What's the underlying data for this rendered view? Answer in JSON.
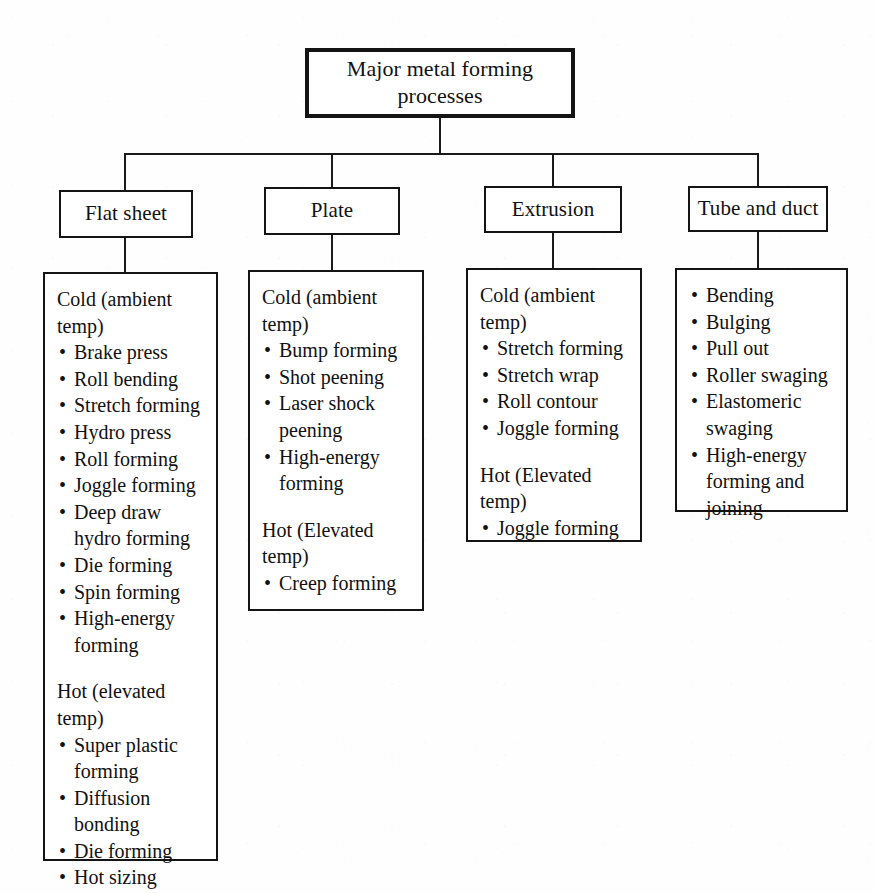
{
  "figure": {
    "type": "tree-diagram",
    "root": {
      "label": "Major metal forming processes"
    },
    "branches": [
      {
        "key": "flat-sheet",
        "label": "Flat sheet",
        "detail": [
          {
            "kind": "heading",
            "text": "Cold (ambient temp)"
          },
          {
            "kind": "bullet",
            "text": "Brake press"
          },
          {
            "kind": "bullet",
            "text": "Roll bending"
          },
          {
            "kind": "bullet",
            "text": "Stretch forming"
          },
          {
            "kind": "bullet",
            "text": "Hydro press"
          },
          {
            "kind": "bullet",
            "text": "Roll forming"
          },
          {
            "kind": "bullet",
            "text": "Joggle forming"
          },
          {
            "kind": "bullet",
            "text": "Deep draw hydro forming"
          },
          {
            "kind": "bullet",
            "text": "Die forming"
          },
          {
            "kind": "bullet",
            "text": "Spin forming"
          },
          {
            "kind": "bullet",
            "text": "High-energy forming"
          },
          {
            "kind": "spacer",
            "text": ""
          },
          {
            "kind": "heading",
            "text": "Hot (elevated temp)"
          },
          {
            "kind": "bullet",
            "text": "Super plastic forming"
          },
          {
            "kind": "bullet",
            "text": "Diffusion bonding"
          },
          {
            "kind": "bullet",
            "text": "Die forming"
          },
          {
            "kind": "bullet",
            "text": "Hot sizing"
          }
        ]
      },
      {
        "key": "plate",
        "label": "Plate",
        "detail": [
          {
            "kind": "heading",
            "text": "Cold (ambient temp)"
          },
          {
            "kind": "bullet",
            "text": "Bump forming"
          },
          {
            "kind": "bullet",
            "text": "Shot peening"
          },
          {
            "kind": "bullet",
            "text": "Laser shock peening"
          },
          {
            "kind": "bullet",
            "text": "High-energy forming"
          },
          {
            "kind": "spacer",
            "text": ""
          },
          {
            "kind": "heading",
            "text": "Hot (Elevated temp)"
          },
          {
            "kind": "bullet",
            "text": "Creep forming"
          }
        ]
      },
      {
        "key": "extrusion",
        "label": "Extrusion",
        "detail": [
          {
            "kind": "heading",
            "text": "Cold (ambient temp)"
          },
          {
            "kind": "bullet",
            "text": "Stretch forming"
          },
          {
            "kind": "bullet",
            "text": "Stretch wrap"
          },
          {
            "kind": "bullet",
            "text": "Roll contour"
          },
          {
            "kind": "bullet",
            "text": "Joggle forming"
          },
          {
            "kind": "spacer",
            "text": ""
          },
          {
            "kind": "heading",
            "text": "Hot (Elevated temp)"
          },
          {
            "kind": "bullet",
            "text": "Joggle forming"
          }
        ]
      },
      {
        "key": "tube-and-duct",
        "label": "Tube and duct",
        "detail": [
          {
            "kind": "bullet",
            "text": "Bending"
          },
          {
            "kind": "bullet",
            "text": "Bulging"
          },
          {
            "kind": "bullet",
            "text": "Pull out"
          },
          {
            "kind": "bullet",
            "text": "Roller swaging"
          },
          {
            "kind": "bullet",
            "text": "Elastomeric swaging"
          },
          {
            "kind": "bullet",
            "text": "High-energy forming and joining"
          }
        ]
      }
    ],
    "bullet_glyph": "•",
    "colors": {
      "ink": "#141414",
      "paper": "#fefefe"
    }
  }
}
